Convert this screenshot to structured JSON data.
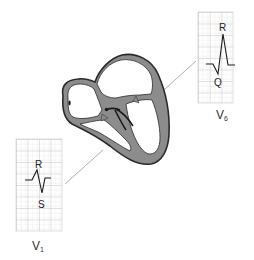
{
  "figure": {
    "colors": {
      "background": "#ffffff",
      "myocardium": "#8c8c8c",
      "outline": "#2a2a2a",
      "grid_minor": "#d4d4d4",
      "grid_major": "#b8b8b8",
      "trace": "#1a1a1a",
      "leader_line": "#9a9a9a"
    },
    "leads": {
      "v6": {
        "name": "V",
        "subscript": "6",
        "waves": {
          "top": "R",
          "bottom": "Q"
        }
      },
      "v1": {
        "name": "V",
        "subscript": "1",
        "waves": {
          "top": "R",
          "bottom": "S"
        }
      }
    }
  }
}
